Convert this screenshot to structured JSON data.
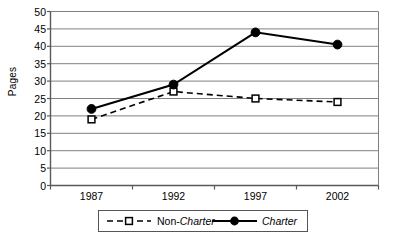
{
  "chart_data": {
    "type": "line",
    "title": "",
    "xlabel": "",
    "ylabel": "Pages",
    "categories": [
      "1987",
      "1992",
      "1997",
      "2002"
    ],
    "x": [
      1987,
      1992,
      1997,
      2002
    ],
    "series": [
      {
        "name": "Non-Charter",
        "name_prefix": "Non-",
        "name_italic": "Charter",
        "values": [
          19,
          27,
          25,
          24
        ],
        "line_style": "dashed",
        "marker": "open-square",
        "color": "#000000"
      },
      {
        "name": "Charter",
        "name_prefix": "",
        "name_italic": "Charter",
        "values": [
          22,
          29,
          44,
          40.5
        ],
        "line_style": "solid",
        "marker": "filled-circle",
        "color": "#000000"
      }
    ],
    "ylim": [
      0,
      50
    ],
    "yticks": [
      0,
      5,
      10,
      15,
      20,
      25,
      30,
      35,
      40,
      45,
      50
    ],
    "ytick_labels": [
      "0",
      "5",
      "10",
      "15",
      "20",
      "25",
      "30",
      "35",
      "40",
      "45",
      "50"
    ],
    "grid": "horizontal",
    "legend_position": "bottom",
    "legend_entries": [
      "Non-Charter",
      "Charter"
    ],
    "plot_bg": "#ffffff",
    "grid_color": "#808080",
    "axis_color": "#595959"
  }
}
